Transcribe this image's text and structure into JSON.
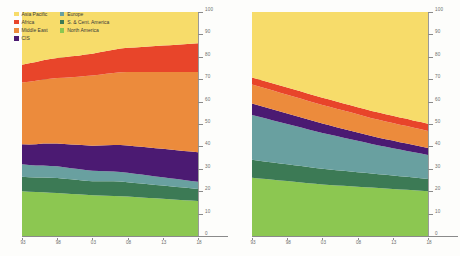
{
  "legend": {
    "position": "top-left",
    "columns": [
      [
        {
          "label": "Asia Pacific",
          "color": "#f7dc6a",
          "key": "asia_pacific"
        },
        {
          "label": "Africa",
          "color": "#e8452a",
          "key": "africa"
        },
        {
          "label": "Middle East",
          "color": "#ec8b3c",
          "key": "middle_east"
        },
        {
          "label": "CIS",
          "color": "#4b1a72",
          "key": "cis"
        }
      ],
      [
        {
          "label": "Europe",
          "color": "#69a0a0",
          "key": "europe"
        },
        {
          "label": "S. & Cent. America",
          "color": "#3c7a55",
          "key": "s_cent_america"
        },
        {
          "label": "North America",
          "color": "#8cc751",
          "key": "north_america"
        }
      ]
    ]
  },
  "axes": {
    "y_ticks": [
      "0",
      "10",
      "20",
      "30",
      "40",
      "50",
      "60",
      "70",
      "80",
      "90",
      "100"
    ],
    "x_ticks": [
      "93",
      "98",
      "03",
      "08",
      "13",
      "18"
    ]
  },
  "chart_data": [
    {
      "id": "left-chart",
      "type": "area",
      "stacked": true,
      "normalized": true,
      "title": "",
      "subtitle": "",
      "xlabel": "",
      "ylabel": "",
      "ylim": [
        0,
        100
      ],
      "grid": true,
      "legend_position": "top-left",
      "x": [
        1993,
        1994,
        1995,
        1996,
        1997,
        1998,
        1999,
        2000,
        2001,
        2002,
        2003,
        2004,
        2005,
        2006,
        2007,
        2008,
        2009,
        2010,
        2011,
        2012,
        2013,
        2014,
        2015,
        2016,
        2017,
        2018
      ],
      "x_tick_labels": [
        "93",
        "98",
        "03",
        "08",
        "13",
        "18"
      ],
      "series": [
        {
          "name": "North America",
          "color": "#8cc751",
          "values": [
            20.0,
            19.8,
            19.6,
            19.5,
            19.3,
            19.2,
            19.0,
            18.8,
            18.6,
            18.4,
            18.2,
            18.1,
            18.0,
            17.9,
            17.8,
            17.6,
            17.4,
            17.2,
            17.0,
            16.8,
            16.6,
            16.4,
            16.2,
            16.0,
            15.8,
            15.6
          ]
        },
        {
          "name": "S. & Cent. America",
          "color": "#3c7a55",
          "values": [
            6.4,
            6.4,
            6.5,
            6.6,
            6.7,
            6.7,
            6.6,
            6.5,
            6.4,
            6.3,
            6.2,
            6.3,
            6.4,
            6.5,
            6.5,
            6.4,
            6.3,
            6.2,
            6.1,
            6.0,
            5.9,
            5.8,
            5.7,
            5.6,
            5.5,
            5.4
          ]
        },
        {
          "name": "Europe",
          "color": "#69a0a0",
          "values": [
            5.6,
            5.5,
            5.4,
            5.4,
            5.3,
            5.2,
            5.1,
            5.0,
            4.9,
            4.8,
            4.7,
            4.6,
            4.5,
            4.4,
            4.3,
            4.2,
            4.1,
            4.0,
            3.9,
            3.8,
            3.7,
            3.6,
            3.5,
            3.4,
            3.3,
            3.2
          ]
        },
        {
          "name": "CIS",
          "color": "#4b1a72",
          "values": [
            9.0,
            9.2,
            9.5,
            9.8,
            10.0,
            10.2,
            10.4,
            10.6,
            10.8,
            11.0,
            11.2,
            11.4,
            11.6,
            11.8,
            12.0,
            12.2,
            12.3,
            12.4,
            12.5,
            12.6,
            12.7,
            12.8,
            12.9,
            13.0,
            13.1,
            13.2
          ]
        },
        {
          "name": "Middle East",
          "color": "#ec8b3c",
          "values": [
            27.5,
            28.0,
            28.3,
            28.6,
            28.9,
            29.2,
            29.6,
            30.0,
            30.4,
            30.9,
            31.3,
            31.6,
            31.9,
            32.2,
            32.5,
            32.8,
            33.1,
            33.4,
            33.7,
            34.0,
            34.3,
            34.6,
            34.9,
            35.2,
            35.5,
            35.8
          ]
        },
        {
          "name": "Africa",
          "color": "#e8452a",
          "values": [
            8.0,
            8.2,
            8.4,
            8.6,
            8.8,
            9.0,
            9.1,
            9.3,
            9.4,
            9.6,
            9.8,
            10.0,
            10.2,
            10.4,
            10.6,
            10.8,
            11.0,
            11.2,
            11.4,
            11.6,
            11.8,
            12.0,
            12.2,
            12.4,
            12.6,
            12.8
          ]
        },
        {
          "name": "Asia Pacific",
          "color": "#f7dc6a",
          "values": [
            23.5,
            22.9,
            22.3,
            21.5,
            21.0,
            20.5,
            20.2,
            19.8,
            19.5,
            19.0,
            18.6,
            18.0,
            17.4,
            16.8,
            16.3,
            16.0,
            15.8,
            15.6,
            15.4,
            15.2,
            15.0,
            14.8,
            14.6,
            14.4,
            14.2,
            14.0
          ]
        }
      ]
    },
    {
      "id": "right-chart",
      "type": "area",
      "stacked": true,
      "normalized": true,
      "title": "",
      "subtitle": "",
      "xlabel": "",
      "ylabel": "",
      "ylim": [
        0,
        100
      ],
      "grid": true,
      "legend_position": "none",
      "x": [
        1993,
        1994,
        1995,
        1996,
        1997,
        1998,
        1999,
        2000,
        2001,
        2002,
        2003,
        2004,
        2005,
        2006,
        2007,
        2008,
        2009,
        2010,
        2011,
        2012,
        2013,
        2014,
        2015,
        2016,
        2017,
        2018
      ],
      "x_tick_labels": [
        "93",
        "98",
        "03",
        "08",
        "13",
        "18"
      ],
      "series": [
        {
          "name": "North America",
          "color": "#8cc751",
          "values": [
            26.0,
            25.7,
            25.4,
            25.1,
            24.8,
            24.5,
            24.2,
            23.9,
            23.6,
            23.3,
            23.0,
            22.8,
            22.6,
            22.4,
            22.2,
            22.0,
            21.8,
            21.6,
            21.4,
            21.2,
            21.0,
            20.8,
            20.6,
            20.4,
            20.2,
            20.0
          ]
        },
        {
          "name": "S. & Cent. America",
          "color": "#3c7a55",
          "values": [
            8.0,
            7.9,
            7.8,
            7.7,
            7.6,
            7.5,
            7.4,
            7.3,
            7.2,
            7.1,
            7.0,
            6.9,
            6.8,
            6.7,
            6.6,
            6.5,
            6.4,
            6.3,
            6.2,
            6.1,
            6.0,
            5.9,
            5.8,
            5.7,
            5.6,
            5.5
          ]
        },
        {
          "name": "Europe",
          "color": "#69a0a0",
          "values": [
            20.0,
            19.6,
            19.2,
            18.8,
            18.4,
            18.0,
            17.6,
            17.2,
            16.8,
            16.4,
            16.0,
            15.6,
            15.2,
            14.8,
            14.4,
            14.0,
            13.6,
            13.2,
            12.8,
            12.5,
            12.2,
            11.9,
            11.6,
            11.3,
            11.0,
            10.7
          ]
        },
        {
          "name": "CIS",
          "color": "#4b1a72",
          "values": [
            5.2,
            5.1,
            5.0,
            4.9,
            4.8,
            4.7,
            4.6,
            4.5,
            4.4,
            4.3,
            4.2,
            4.1,
            4.0,
            3.9,
            3.8,
            3.7,
            3.6,
            3.5,
            3.5,
            3.4,
            3.4,
            3.3,
            3.3,
            3.2,
            3.2,
            3.1
          ]
        },
        {
          "name": "Middle East",
          "color": "#ec8b3c",
          "values": [
            8.4,
            8.4,
            8.4,
            8.4,
            8.4,
            8.4,
            8.4,
            8.4,
            8.3,
            8.3,
            8.3,
            8.3,
            8.2,
            8.2,
            8.2,
            8.1,
            8.1,
            8.0,
            8.0,
            7.9,
            7.9,
            7.8,
            7.8,
            7.7,
            7.7,
            7.6
          ]
        },
        {
          "name": "Africa",
          "color": "#e8452a",
          "values": [
            3.2,
            3.2,
            3.2,
            3.2,
            3.2,
            3.2,
            3.2,
            3.2,
            3.2,
            3.2,
            3.2,
            3.2,
            3.2,
            3.2,
            3.2,
            3.2,
            3.2,
            3.2,
            3.2,
            3.2,
            3.2,
            3.2,
            3.2,
            3.2,
            3.2,
            3.2
          ]
        },
        {
          "name": "Asia Pacific",
          "color": "#f7dc6a",
          "values": [
            29.2,
            30.1,
            31.0,
            31.9,
            32.8,
            33.7,
            34.6,
            35.5,
            36.5,
            37.4,
            38.3,
            39.1,
            40.0,
            40.8,
            41.6,
            42.5,
            43.3,
            44.2,
            44.9,
            45.7,
            46.3,
            47.1,
            47.7,
            48.5,
            49.1,
            49.9
          ]
        }
      ]
    }
  ]
}
